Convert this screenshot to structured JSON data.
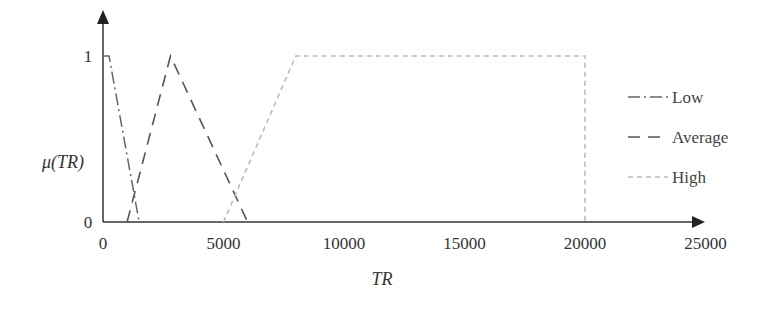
{
  "chart_data": {
    "type": "line",
    "title": "",
    "xlabel": "TR",
    "ylabel": "μ(TR)",
    "xlim": [
      0,
      25000
    ],
    "ylim": [
      0,
      1
    ],
    "xticks": [
      0,
      5000,
      10000,
      15000,
      20000,
      25000
    ],
    "xtick_labels": [
      "0",
      "5000",
      "10000",
      "15000",
      "20000",
      "25000"
    ],
    "yticks": [
      0,
      1
    ],
    "ytick_labels": [
      "0",
      "1"
    ],
    "grid": false,
    "legend_position": "right",
    "series": [
      {
        "name": "Low",
        "style": "dash-dot",
        "color": "#666666",
        "x": [
          0,
          250,
          1500
        ],
        "y": [
          1,
          1,
          0
        ]
      },
      {
        "name": "Average",
        "style": "dashed",
        "color": "#555555",
        "x": [
          1000,
          2800,
          6000
        ],
        "y": [
          0,
          1,
          0
        ]
      },
      {
        "name": "High",
        "style": "dotted-dash",
        "color": "#bbbbbb",
        "x": [
          5000,
          8000,
          20000,
          20000
        ],
        "y": [
          0,
          1,
          1,
          0
        ]
      }
    ]
  },
  "legend": {
    "items": [
      {
        "label": "Low"
      },
      {
        "label": "Average"
      },
      {
        "label": "High"
      }
    ]
  }
}
